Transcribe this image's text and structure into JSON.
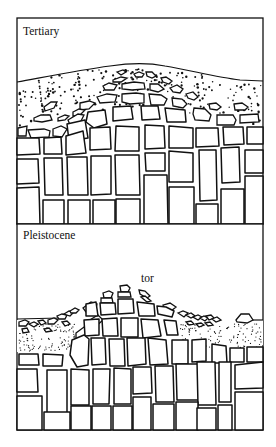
{
  "figure": {
    "panels": [
      {
        "id": "tertiary",
        "label": "Tertiary",
        "description": "Deeply weathered granite: corestones in a regolith of grus beneath a smooth land surface"
      },
      {
        "id": "pleistocene",
        "label": "Pleistocene",
        "annotation": "tor",
        "description": "Regolith stripped away exposing a tor of jointed blocks; residual debris on flanks"
      }
    ],
    "colors": {
      "ink": "#111111",
      "paper": "#ffffff"
    }
  }
}
